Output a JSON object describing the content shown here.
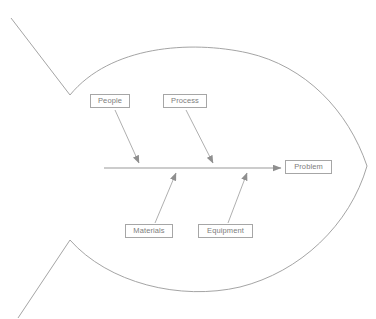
{
  "diagram": {
    "type": "fishbone-ishikawa",
    "title": "",
    "background_color": "#ffffff",
    "line_color": "#9a9a9a",
    "box_border_color": "#a6a6a6",
    "text_color": "#7d7d7d",
    "spine": {
      "label": "",
      "start_x": 104,
      "end_x": 283,
      "y": 168,
      "arrowhead": "right"
    },
    "effect": {
      "label": "Problem",
      "box": {
        "x": 285,
        "y": 160,
        "width": 47,
        "height": 15
      }
    },
    "causes": [
      {
        "label": "People",
        "position": "top",
        "box": {
          "x": 90,
          "y": 94,
          "width": 40,
          "height": 15
        },
        "arrow": {
          "from_x": 115,
          "from_y": 110,
          "to_x": 140,
          "to_y": 165
        }
      },
      {
        "label": "Process",
        "position": "top",
        "box": {
          "x": 163,
          "y": 94,
          "width": 44,
          "height": 15
        },
        "arrow": {
          "from_x": 186,
          "from_y": 110,
          "to_x": 214,
          "to_y": 165
        }
      },
      {
        "label": "Materials",
        "position": "bottom",
        "box": {
          "x": 125,
          "y": 224,
          "width": 48,
          "height": 15
        },
        "arrow": {
          "from_x": 155,
          "from_y": 223,
          "to_x": 175,
          "to_y": 171
        }
      },
      {
        "label": "Equipment",
        "position": "bottom",
        "box": {
          "x": 198,
          "y": 224,
          "width": 55,
          "height": 15
        },
        "arrow": {
          "from_x": 228,
          "from_y": 223,
          "to_x": 246,
          "to_y": 171
        }
      }
    ],
    "fish_outline": {
      "tail_upper_tip": {
        "x": 11,
        "y": 18
      },
      "tail_upper_vertex": {
        "x": 70,
        "y": 95
      },
      "tail_lower_vertex": {
        "x": 70,
        "y": 240
      },
      "tail_lower_tip": {
        "x": 18,
        "y": 318
      },
      "nose": {
        "x": 367,
        "y": 166
      },
      "body_top_peak_y": 42,
      "body_bottom_peak_y": 291
    }
  }
}
